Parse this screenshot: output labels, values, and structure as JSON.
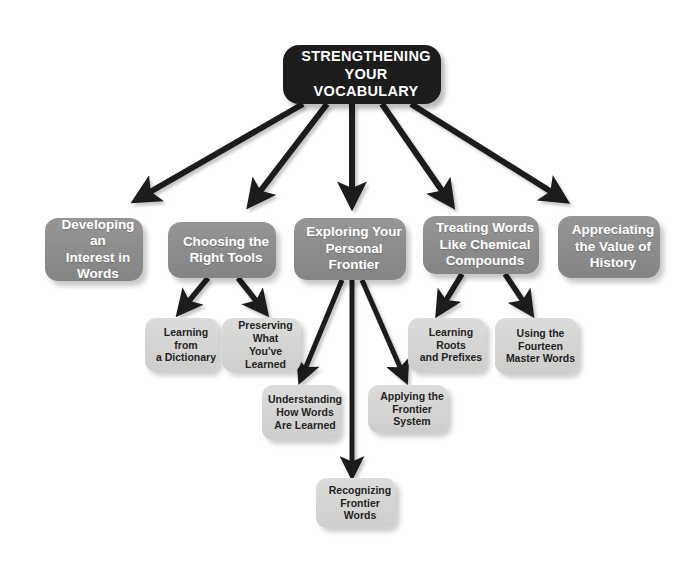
{
  "diagram": {
    "colors": {
      "root_fill": "#1c1c1c",
      "root_text": "#ffffff",
      "level2_fill": "#8b8b8b",
      "level2_text": "#ffffff",
      "level3_fill": "#d3d3d1",
      "level3_text": "#242424",
      "arrow": "#1f1f1f",
      "background": "#ffffff"
    },
    "root": {
      "id": "root",
      "label": "STRENGTHENING\nYOUR\nVOCABULARY",
      "lines": [
        "STRENGTHENING",
        "YOUR",
        "VOCABULARY"
      ]
    },
    "level2": [
      {
        "id": "developing-interest",
        "label": "Developing an Interest in Words",
        "lines": [
          "Developing an",
          "Interest in",
          "Words"
        ]
      },
      {
        "id": "choosing-tools",
        "label": "Choosing the Right Tools",
        "lines": [
          "Choosing the",
          "Right Tools"
        ]
      },
      {
        "id": "exploring-frontier",
        "label": "Exploring Your Personal Frontier",
        "lines": [
          "Exploring Your",
          "Personal",
          "Frontier"
        ]
      },
      {
        "id": "treating-words",
        "label": "Treating Words Like Chemical Compounds",
        "lines": [
          "Treating Words",
          "Like Chemical",
          "Compounds"
        ]
      },
      {
        "id": "appreciating-history",
        "label": "Appreciating the Value of History",
        "lines": [
          "Appreciating",
          "the Value of",
          "History"
        ]
      }
    ],
    "level3": [
      {
        "id": "learning-dictionary",
        "parent": "choosing-tools",
        "label": "Learning from a Dictionary",
        "lines": [
          "Learning from",
          "a Dictionary"
        ]
      },
      {
        "id": "preserving-learned",
        "parent": "choosing-tools",
        "label": "Preserving What You've Learned",
        "lines": [
          "Preserving What",
          "You've Learned"
        ]
      },
      {
        "id": "learning-roots",
        "parent": "treating-words",
        "label": "Learning Roots and Prefixes",
        "lines": [
          "Learning Roots",
          "and Prefixes"
        ]
      },
      {
        "id": "fourteen-master",
        "parent": "treating-words",
        "label": "Using the Fourteen Master Words",
        "lines": [
          "Using the",
          "Fourteen",
          "Master Words"
        ]
      },
      {
        "id": "understanding-words",
        "parent": "exploring-frontier",
        "label": "Understanding How Words Are Learned",
        "lines": [
          "Understanding",
          "How Words",
          "Are Learned"
        ]
      },
      {
        "id": "applying-frontier",
        "parent": "exploring-frontier",
        "label": "Applying the Frontier System",
        "lines": [
          "Applying the",
          "Frontier System"
        ]
      },
      {
        "id": "recognizing-frontier",
        "parent": "exploring-frontier",
        "label": "Recognizing Frontier Words",
        "lines": [
          "Recognizing",
          "Frontier Words"
        ]
      }
    ],
    "edges": [
      {
        "from": "root",
        "to": "developing-interest"
      },
      {
        "from": "root",
        "to": "choosing-tools"
      },
      {
        "from": "root",
        "to": "exploring-frontier"
      },
      {
        "from": "root",
        "to": "treating-words"
      },
      {
        "from": "root",
        "to": "appreciating-history"
      },
      {
        "from": "choosing-tools",
        "to": "learning-dictionary"
      },
      {
        "from": "choosing-tools",
        "to": "preserving-learned"
      },
      {
        "from": "treating-words",
        "to": "learning-roots"
      },
      {
        "from": "treating-words",
        "to": "fourteen-master"
      },
      {
        "from": "exploring-frontier",
        "to": "understanding-words"
      },
      {
        "from": "exploring-frontier",
        "to": "applying-frontier"
      },
      {
        "from": "exploring-frontier",
        "to": "recognizing-frontier"
      }
    ]
  }
}
